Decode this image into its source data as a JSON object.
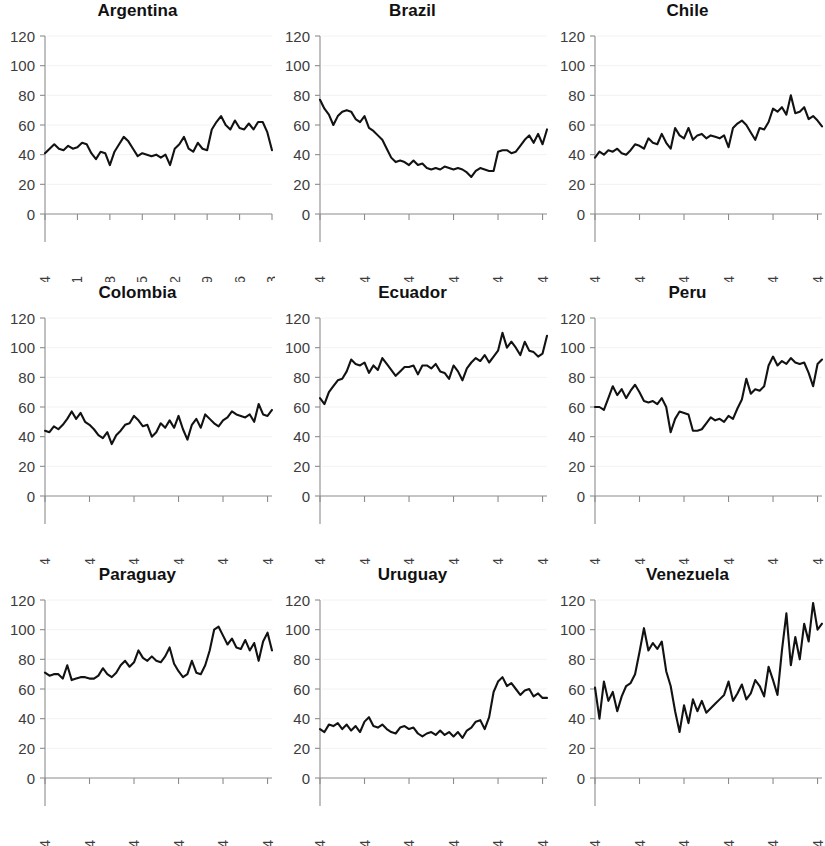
{
  "figure": {
    "layout": "3x3 small multiples",
    "rows": 3,
    "columns": 3
  },
  "chart_data": [
    {
      "type": "line",
      "title": "Argentina",
      "xlabel": "",
      "ylabel": "",
      "ylim": [
        0,
        120
      ],
      "ytick_labels": [
        "0",
        "20",
        "40",
        "60",
        "80",
        "100",
        "120"
      ],
      "yticks": [
        0,
        20,
        40,
        60,
        80,
        100,
        120
      ],
      "xlim": [
        1964,
        2013
      ],
      "xtick_labels": [
        "1964",
        "1971",
        "1978",
        "1985",
        "1992",
        "1999",
        "2006",
        "2013"
      ],
      "xticks": [
        1964,
        1971,
        1978,
        1985,
        1992,
        1999,
        2006,
        2013
      ],
      "grid": false,
      "legend": "none",
      "x": [
        1964,
        1965,
        1966,
        1967,
        1968,
        1969,
        1970,
        1971,
        1972,
        1973,
        1974,
        1975,
        1976,
        1977,
        1978,
        1979,
        1980,
        1981,
        1982,
        1983,
        1984,
        1985,
        1986,
        1987,
        1988,
        1989,
        1990,
        1991,
        1992,
        1993,
        1994,
        1995,
        1996,
        1997,
        1998,
        1999,
        2000,
        2001,
        2002,
        2003,
        2004,
        2005,
        2006,
        2007,
        2008,
        2009,
        2010,
        2011,
        2012,
        2013
      ],
      "values": [
        41,
        44,
        47,
        44,
        43,
        46,
        44,
        45,
        48,
        47,
        41,
        37,
        42,
        41,
        33,
        42,
        47,
        52,
        49,
        44,
        39,
        41,
        40,
        39,
        40,
        38,
        40,
        33,
        44,
        47,
        52,
        44,
        42,
        48,
        44,
        43,
        57,
        62,
        66,
        60,
        57,
        63,
        58,
        57,
        61,
        57,
        62,
        62,
        55,
        43
      ]
    },
    {
      "type": "line",
      "title": "Brazil",
      "xlabel": "",
      "ylabel": "",
      "ylim": [
        0,
        120
      ],
      "ytick_labels": [
        "0",
        "20",
        "40",
        "60",
        "80",
        "100",
        "120"
      ],
      "yticks": [
        0,
        20,
        40,
        60,
        80,
        100,
        120
      ],
      "xlim": [
        1964,
        2015
      ],
      "xtick_labels": [
        "1964",
        "1974",
        "1984",
        "1994",
        "2004",
        "2014"
      ],
      "xticks": [
        1964,
        1974,
        1984,
        1994,
        2004,
        2014
      ],
      "grid": false,
      "legend": "none",
      "x": [
        1964,
        1965,
        1966,
        1967,
        1968,
        1969,
        1970,
        1971,
        1972,
        1973,
        1974,
        1975,
        1976,
        1977,
        1978,
        1979,
        1980,
        1981,
        1982,
        1983,
        1984,
        1985,
        1986,
        1987,
        1988,
        1989,
        1990,
        1991,
        1992,
        1993,
        1994,
        1995,
        1996,
        1997,
        1998,
        1999,
        2000,
        2001,
        2002,
        2003,
        2004,
        2005,
        2006,
        2007,
        2008,
        2009,
        2010,
        2011,
        2012,
        2013,
        2014,
        2015
      ],
      "values": [
        77,
        71,
        67,
        60,
        66,
        69,
        70,
        69,
        64,
        62,
        66,
        58,
        56,
        53,
        50,
        44,
        38,
        35,
        36,
        35,
        33,
        36,
        33,
        34,
        31,
        30,
        31,
        30,
        32,
        31,
        30,
        31,
        30,
        28,
        25,
        29,
        31,
        30,
        29,
        29,
        42,
        43,
        43,
        41,
        42,
        46,
        50,
        53,
        48,
        54,
        47,
        57,
        32
      ]
    },
    {
      "type": "line",
      "title": "Chile",
      "xlabel": "",
      "ylabel": "",
      "ylim": [
        0,
        120
      ],
      "ytick_labels": [
        "0",
        "20",
        "40",
        "60",
        "80",
        "100",
        "120"
      ],
      "yticks": [
        0,
        20,
        40,
        60,
        80,
        100,
        120
      ],
      "xlim": [
        1964,
        2015
      ],
      "xtick_labels": [
        "1964",
        "1974",
        "1984",
        "1994",
        "2004",
        "2014"
      ],
      "xticks": [
        1964,
        1974,
        1984,
        1994,
        2004,
        2014
      ],
      "grid": false,
      "legend": "none",
      "x": [
        1964,
        1965,
        1966,
        1967,
        1968,
        1969,
        1970,
        1971,
        1972,
        1973,
        1974,
        1975,
        1976,
        1977,
        1978,
        1979,
        1980,
        1981,
        1982,
        1983,
        1984,
        1985,
        1986,
        1987,
        1988,
        1989,
        1990,
        1991,
        1992,
        1993,
        1994,
        1995,
        1996,
        1997,
        1998,
        1999,
        2000,
        2001,
        2002,
        2003,
        2004,
        2005,
        2006,
        2007,
        2008,
        2009,
        2010,
        2011,
        2012,
        2013,
        2014,
        2015
      ],
      "values": [
        38,
        42,
        40,
        43,
        42,
        44,
        41,
        40,
        43,
        47,
        46,
        44,
        51,
        48,
        47,
        54,
        48,
        44,
        58,
        53,
        51,
        58,
        50,
        53,
        54,
        51,
        53,
        52,
        51,
        53,
        45,
        58,
        61,
        63,
        60,
        55,
        50,
        58,
        57,
        62,
        71,
        69,
        72,
        67,
        80,
        68,
        69,
        72,
        64,
        66,
        63,
        59
      ]
    },
    {
      "type": "line",
      "title": "Colombia",
      "xlabel": "",
      "ylabel": "",
      "ylim": [
        0,
        120
      ],
      "ytick_labels": [
        "0",
        "20",
        "40",
        "60",
        "80",
        "100",
        "120"
      ],
      "yticks": [
        0,
        20,
        40,
        60,
        80,
        100,
        120
      ],
      "xlim": [
        1964,
        2015
      ],
      "xtick_labels": [
        "1964",
        "1974",
        "1984",
        "1994",
        "2004",
        "2014"
      ],
      "xticks": [
        1964,
        1974,
        1984,
        1994,
        2004,
        2014
      ],
      "grid": false,
      "legend": "none",
      "x": [
        1964,
        1965,
        1966,
        1967,
        1968,
        1969,
        1970,
        1971,
        1972,
        1973,
        1974,
        1975,
        1976,
        1977,
        1978,
        1979,
        1980,
        1981,
        1982,
        1983,
        1984,
        1985,
        1986,
        1987,
        1988,
        1989,
        1990,
        1991,
        1992,
        1993,
        1994,
        1995,
        1996,
        1997,
        1998,
        1999,
        2000,
        2001,
        2002,
        2003,
        2004,
        2005,
        2006,
        2007,
        2008,
        2009,
        2010,
        2011,
        2012,
        2013,
        2014,
        2015
      ],
      "values": [
        44,
        43,
        47,
        45,
        48,
        52,
        57,
        52,
        56,
        50,
        48,
        45,
        41,
        39,
        43,
        35,
        41,
        44,
        48,
        49,
        54,
        51,
        47,
        48,
        40,
        43,
        49,
        46,
        51,
        46,
        54,
        45,
        38,
        48,
        52,
        46,
        55,
        52,
        49,
        47,
        51,
        53,
        57,
        55,
        54,
        53,
        55,
        50,
        62,
        55,
        54,
        58
      ]
    },
    {
      "type": "line",
      "title": "Ecuador",
      "xlabel": "",
      "ylabel": "",
      "ylim": [
        0,
        120
      ],
      "ytick_labels": [
        "0",
        "20",
        "40",
        "60",
        "80",
        "100",
        "120"
      ],
      "yticks": [
        0,
        20,
        40,
        60,
        80,
        100,
        120
      ],
      "xlim": [
        1964,
        2015
      ],
      "xtick_labels": [
        "1964",
        "1974",
        "1984",
        "1994",
        "2004",
        "2014"
      ],
      "xticks": [
        1964,
        1974,
        1984,
        1994,
        2004,
        2014
      ],
      "grid": false,
      "legend": "none",
      "x": [
        1964,
        1965,
        1966,
        1967,
        1968,
        1969,
        1970,
        1971,
        1972,
        1973,
        1974,
        1975,
        1976,
        1977,
        1978,
        1979,
        1980,
        1981,
        1982,
        1983,
        1984,
        1985,
        1986,
        1987,
        1988,
        1989,
        1990,
        1991,
        1992,
        1993,
        1994,
        1995,
        1996,
        1997,
        1998,
        1999,
        2000,
        2001,
        2002,
        2003,
        2004,
        2005,
        2006,
        2007,
        2008,
        2009,
        2010,
        2011,
        2012,
        2013,
        2014,
        2015
      ],
      "values": [
        66,
        62,
        70,
        74,
        78,
        79,
        84,
        92,
        89,
        88,
        90,
        83,
        88,
        85,
        93,
        89,
        85,
        81,
        84,
        87,
        87,
        88,
        82,
        88,
        88,
        86,
        89,
        84,
        83,
        79,
        88,
        84,
        78,
        86,
        90,
        93,
        91,
        95,
        90,
        94,
        98,
        110,
        100,
        104,
        100,
        95,
        104,
        98,
        97,
        94,
        96,
        108
      ]
    },
    {
      "type": "line",
      "title": "Peru",
      "xlabel": "",
      "ylabel": "",
      "ylim": [
        0,
        120
      ],
      "ytick_labels": [
        "0",
        "20",
        "40",
        "60",
        "80",
        "100",
        "120"
      ],
      "yticks": [
        0,
        20,
        40,
        60,
        80,
        100,
        120
      ],
      "xlim": [
        1964,
        2015
      ],
      "xtick_labels": [
        "1964",
        "1974",
        "1984",
        "1994",
        "2004",
        "2014"
      ],
      "xticks": [
        1964,
        1974,
        1984,
        1994,
        2004,
        2014
      ],
      "grid": false,
      "legend": "none",
      "x": [
        1964,
        1965,
        1966,
        1967,
        1968,
        1969,
        1970,
        1971,
        1972,
        1973,
        1974,
        1975,
        1976,
        1977,
        1978,
        1979,
        1980,
        1981,
        1982,
        1983,
        1984,
        1985,
        1986,
        1987,
        1988,
        1989,
        1990,
        1991,
        1992,
        1993,
        1994,
        1995,
        1996,
        1997,
        1998,
        1999,
        2000,
        2001,
        2002,
        2003,
        2004,
        2005,
        2006,
        2007,
        2008,
        2009,
        2010,
        2011,
        2012,
        2013,
        2014,
        2015
      ],
      "values": [
        60,
        60,
        58,
        66,
        74,
        68,
        72,
        66,
        71,
        75,
        70,
        64,
        63,
        64,
        62,
        66,
        60,
        43,
        52,
        57,
        56,
        55,
        44,
        44,
        45,
        49,
        53,
        51,
        52,
        50,
        54,
        52,
        59,
        65,
        79,
        69,
        72,
        71,
        74,
        88,
        94,
        88,
        91,
        89,
        93,
        90,
        89,
        90,
        83,
        74,
        89,
        92
      ]
    },
    {
      "type": "line",
      "title": "Paraguay",
      "xlabel": "",
      "ylabel": "",
      "ylim": [
        0,
        120
      ],
      "ytick_labels": [
        "0",
        "20",
        "40",
        "60",
        "80",
        "100",
        "120"
      ],
      "yticks": [
        0,
        20,
        40,
        60,
        80,
        100,
        120
      ],
      "xlim": [
        1964,
        2015
      ],
      "xtick_labels": [
        "1964",
        "1974",
        "1984",
        "1994",
        "2004",
        "2014"
      ],
      "xticks": [
        1964,
        1974,
        1984,
        1994,
        2004,
        2014
      ],
      "grid": false,
      "legend": "none",
      "x": [
        1964,
        1965,
        1966,
        1967,
        1968,
        1969,
        1970,
        1971,
        1972,
        1973,
        1974,
        1975,
        1976,
        1977,
        1978,
        1979,
        1980,
        1981,
        1982,
        1983,
        1984,
        1985,
        1986,
        1987,
        1988,
        1989,
        1990,
        1991,
        1992,
        1993,
        1994,
        1995,
        1996,
        1997,
        1998,
        1999,
        2000,
        2001,
        2002,
        2003,
        2004,
        2005,
        2006,
        2007,
        2008,
        2009,
        2010,
        2011,
        2012,
        2013,
        2014,
        2015
      ],
      "values": [
        71,
        69,
        70,
        70,
        67,
        76,
        66,
        67,
        68,
        68,
        67,
        67,
        69,
        74,
        70,
        68,
        71,
        76,
        79,
        75,
        78,
        86,
        81,
        79,
        82,
        79,
        78,
        82,
        88,
        77,
        72,
        68,
        70,
        79,
        71,
        70,
        76,
        86,
        100,
        102,
        96,
        90,
        94,
        88,
        87,
        93,
        86,
        91,
        79,
        92,
        98,
        86
      ]
    },
    {
      "type": "line",
      "title": "Uruguay",
      "xlabel": "",
      "ylabel": "",
      "ylim": [
        0,
        120
      ],
      "ytick_labels": [
        "0",
        "20",
        "40",
        "60",
        "80",
        "100",
        "120"
      ],
      "yticks": [
        0,
        20,
        40,
        60,
        80,
        100,
        120
      ],
      "xlim": [
        1964,
        2015
      ],
      "xtick_labels": [
        "1964",
        "1974",
        "1984",
        "1994",
        "2004",
        "2014"
      ],
      "xticks": [
        1964,
        1974,
        1984,
        1994,
        2004,
        2014
      ],
      "grid": false,
      "legend": "none",
      "x": [
        1964,
        1965,
        1966,
        1967,
        1968,
        1969,
        1970,
        1971,
        1972,
        1973,
        1974,
        1975,
        1976,
        1977,
        1978,
        1979,
        1980,
        1981,
        1982,
        1983,
        1984,
        1985,
        1986,
        1987,
        1988,
        1989,
        1990,
        1991,
        1992,
        1993,
        1994,
        1995,
        1996,
        1997,
        1998,
        1999,
        2000,
        2001,
        2002,
        2003,
        2004,
        2005,
        2006,
        2007,
        2008,
        2009,
        2010,
        2011,
        2012,
        2013,
        2014,
        2015
      ],
      "values": [
        33,
        31,
        36,
        35,
        37,
        33,
        36,
        32,
        35,
        31,
        38,
        41,
        35,
        34,
        36,
        33,
        31,
        30,
        34,
        35,
        33,
        34,
        30,
        28,
        30,
        31,
        29,
        32,
        29,
        31,
        28,
        31,
        27,
        32,
        34,
        38,
        39,
        33,
        41,
        58,
        65,
        68,
        62,
        64,
        60,
        56,
        59,
        60,
        55,
        57,
        54,
        54
      ]
    },
    {
      "type": "line",
      "title": "Venezuela",
      "xlabel": "",
      "ylabel": "",
      "ylim": [
        0,
        120
      ],
      "ytick_labels": [
        "0",
        "20",
        "40",
        "60",
        "80",
        "100",
        "120"
      ],
      "yticks": [
        0,
        20,
        40,
        60,
        80,
        100,
        120
      ],
      "xlim": [
        1964,
        2015
      ],
      "xtick_labels": [
        "1964",
        "1974",
        "1984",
        "1994",
        "2004",
        "2014"
      ],
      "xticks": [
        1964,
        1974,
        1984,
        1994,
        2004,
        2014
      ],
      "grid": false,
      "legend": "none",
      "x": [
        1964,
        1965,
        1966,
        1967,
        1968,
        1969,
        1970,
        1971,
        1972,
        1973,
        1974,
        1975,
        1976,
        1977,
        1978,
        1979,
        1980,
        1981,
        1982,
        1983,
        1984,
        1985,
        1986,
        1987,
        1988,
        1989,
        1990,
        1991,
        1992,
        1993,
        1994,
        1995,
        1996,
        1997,
        1998,
        1999,
        2000,
        2001,
        2002,
        2003,
        2004,
        2005,
        2006,
        2007,
        2008,
        2009,
        2010,
        2011,
        2012,
        2013,
        2014,
        2015
      ],
      "values": [
        61,
        40,
        65,
        52,
        58,
        45,
        55,
        62,
        64,
        70,
        85,
        101,
        86,
        91,
        87,
        92,
        72,
        62,
        45,
        31,
        49,
        37,
        53,
        45,
        52,
        44,
        47,
        50,
        53,
        56,
        65,
        52,
        57,
        63,
        53,
        57,
        66,
        62,
        55,
        75,
        66,
        56,
        86,
        111,
        76,
        95,
        80,
        104,
        92,
        118,
        100,
        104
      ]
    }
  ]
}
